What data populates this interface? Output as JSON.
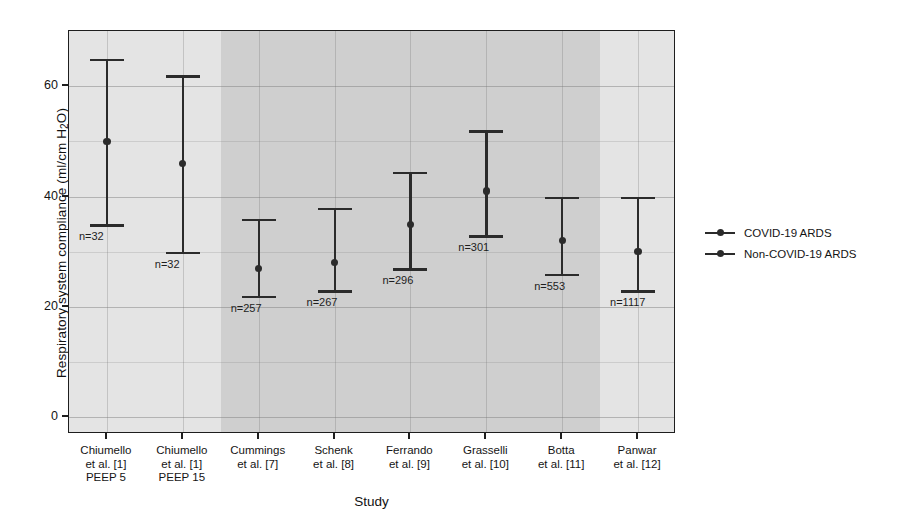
{
  "chart_data": {
    "type": "scatter",
    "title": "",
    "xlabel": "Study",
    "ylabel": "Respiratory system compliance (ml/cm H2O)",
    "ylabel_prefix": "Respiratory system compliance (ml/cm H",
    "ylabel_sub": "2",
    "ylabel_suffix": "O)",
    "ylim": [
      -3,
      70
    ],
    "yticks": [
      0,
      20,
      40,
      60
    ],
    "ytick_labels": [
      "0",
      "20",
      "40",
      "60"
    ],
    "grid": "horizontal and vertical, light gray",
    "legend_position": "right",
    "categories": [
      "Chiumello\net al. [1]\nPEEP 5",
      "Chiumello\net al. [1]\nPEEP 15",
      "Cummings\net al. [7]",
      "Schenk\net al. [8]",
      "Ferrando\net al. [9]",
      "Grasselli\net al. [10]",
      "Botta\net al. [11]",
      "Panwar\net al. [12]"
    ],
    "points": [
      {
        "label_line1": "Chiumello",
        "label_line2": "et al. [1]",
        "label_line3": "PEEP 5",
        "value": 50,
        "low": 35,
        "high": 65,
        "n": "n=32",
        "group": "Non-COVID-19 ARDS",
        "n_side": "left"
      },
      {
        "label_line1": "Chiumello",
        "label_line2": "et al. [1]",
        "label_line3": "PEEP 15",
        "value": 46,
        "low": 30,
        "high": 62,
        "n": "n=32",
        "group": "Non-COVID-19 ARDS",
        "n_side": "left"
      },
      {
        "label_line1": "Cummings",
        "label_line2": "et al. [7]",
        "label_line3": "",
        "value": 27,
        "low": 22,
        "high": 36,
        "n": "n=257",
        "group": "COVID-19 ARDS",
        "n_side": "left"
      },
      {
        "label_line1": "Schenk",
        "label_line2": "et al. [8]",
        "label_line3": "",
        "value": 28,
        "low": 23,
        "high": 38,
        "n": "n=267",
        "group": "COVID-19 ARDS",
        "n_side": "left"
      },
      {
        "label_line1": "Ferrando",
        "label_line2": "et al. [9]",
        "label_line3": "",
        "value": 35,
        "low": 27,
        "high": 44.5,
        "n": "n=296",
        "group": "COVID-19 ARDS",
        "n_side": "left"
      },
      {
        "label_line1": "Grasselli",
        "label_line2": "et al. [10]",
        "label_line3": "",
        "value": 41,
        "low": 33,
        "high": 52,
        "n": "n=301",
        "group": "COVID-19 ARDS",
        "n_side": "left"
      },
      {
        "label_line1": "Botta",
        "label_line2": "et al. [11]",
        "label_line3": "",
        "value": 32,
        "low": 26,
        "high": 40,
        "n": "n=553",
        "group": "COVID-19 ARDS",
        "n_side": "left"
      },
      {
        "label_line1": "Panwar",
        "label_line2": "et al. [12]",
        "label_line3": "",
        "value": 30,
        "low": 23,
        "high": 40,
        "n": "n=1117",
        "group": "COVID-19 ARDS",
        "n_side": "left"
      }
    ],
    "bands": [
      {
        "from_index": 0,
        "to_index": 1,
        "shade": "light",
        "color": "#e4e4e4"
      },
      {
        "from_index": 2,
        "to_index": 6,
        "shade": "dark",
        "color": "#cfcfcf"
      },
      {
        "from_index": 7,
        "to_index": 7,
        "shade": "light",
        "color": "#e4e4e4"
      }
    ],
    "legend": [
      {
        "label": "COVID-19 ARDS",
        "marker": "line-dot",
        "color": "#2b2b2b"
      },
      {
        "label": "Non-COVID-19 ARDS",
        "marker": "line-dot",
        "color": "#2b2b2b"
      }
    ],
    "colors": {
      "marker": "#2b2b2b",
      "axis": "#1e1e1e",
      "band_light": "#e4e4e4",
      "band_dark": "#cfcfcf",
      "grid": "#8a8a8a"
    }
  }
}
